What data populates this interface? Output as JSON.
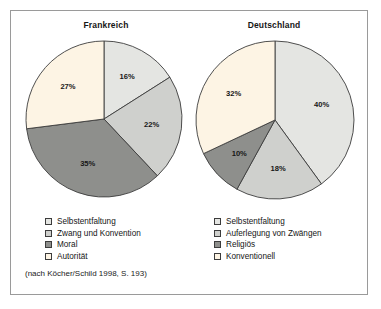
{
  "figure": {
    "source_note": "(nach Köcher/Schild 1998, S. 193)",
    "frame_color": "#9a9a9a",
    "background": "#ffffff"
  },
  "palette": {
    "light_gray": "#e4e5e2",
    "medium_gray": "#cfd0cd",
    "dark_gray": "#8e8f8c",
    "cream": "#fdf4e4",
    "outline": "#3c3c3c"
  },
  "charts": [
    {
      "id": "frankreich",
      "title": "Frankreich",
      "labels": [
        "16%",
        "22%",
        "35%",
        "27%"
      ]
    },
    {
      "id": "deutschland",
      "title": "Deutschland",
      "labels": [
        "40%",
        "18%",
        "10%",
        "32%"
      ]
    }
  ],
  "legends": [
    {
      "id": "legend-frankreich",
      "items": [
        {
          "label": "Selbstentfaltung",
          "color": "#e4e5e2"
        },
        {
          "label": "Zwang und Konvention",
          "color": "#cfd0cd"
        },
        {
          "label": "Moral",
          "color": "#8e8f8c"
        },
        {
          "label": "Autorität",
          "color": "#fdf4e4"
        }
      ]
    },
    {
      "id": "legend-deutschland",
      "items": [
        {
          "label": "Selbstentfaltung",
          "color": "#e4e5e2"
        },
        {
          "label": "Auferlegung von Zwängen",
          "color": "#cfd0cd"
        },
        {
          "label": "Religiös",
          "color": "#8e8f8c"
        },
        {
          "label": "Konventionell",
          "color": "#fdf4e4"
        }
      ]
    }
  ],
  "chart_data": [
    {
      "type": "pie",
      "title": "Frankreich",
      "categories": [
        "Selbstentfaltung",
        "Zwang und Konvention",
        "Moral",
        "Autorität"
      ],
      "values": [
        16,
        22,
        35,
        27
      ],
      "value_labels": [
        "16%",
        "22%",
        "35%",
        "27%"
      ],
      "colors": [
        "#e4e5e2",
        "#cfd0cd",
        "#8e8f8c",
        "#fdf4e4"
      ],
      "unit": "percent",
      "start_angle_deg": 0,
      "direction": "clockwise",
      "legend_position": "below",
      "xlabel": "",
      "ylabel": "",
      "grid": false
    },
    {
      "type": "pie",
      "title": "Deutschland",
      "categories": [
        "Selbstentfaltung",
        "Auferlegung von Zwängen",
        "Religiös",
        "Konventionell"
      ],
      "values": [
        40,
        18,
        10,
        32
      ],
      "value_labels": [
        "40%",
        "18%",
        "10%",
        "32%"
      ],
      "colors": [
        "#e4e5e2",
        "#cfd0cd",
        "#8e8f8c",
        "#fdf4e4"
      ],
      "unit": "percent",
      "start_angle_deg": 0,
      "direction": "clockwise",
      "legend_position": "below",
      "xlabel": "",
      "ylabel": "",
      "grid": false
    }
  ]
}
